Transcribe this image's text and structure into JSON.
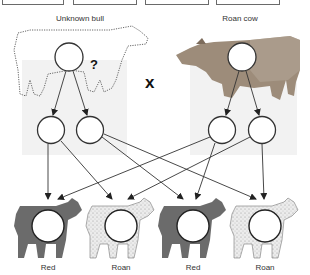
{
  "top_boxes": [
    {
      "name": "answer-box-1"
    },
    {
      "name": "answer-box-2"
    },
    {
      "name": "answer-box-3"
    },
    {
      "name": "answer-box-4"
    }
  ],
  "parents": {
    "left": {
      "label": "Unknown bull",
      "marker": "?"
    },
    "right": {
      "label": "Roan cow"
    },
    "cross_symbol": "x"
  },
  "offspring": [
    {
      "label": "Red",
      "coat": "red"
    },
    {
      "label": "Roan",
      "coat": "roan"
    },
    {
      "label": "Red",
      "coat": "red"
    },
    {
      "label": "Roan",
      "coat": "roan"
    }
  ],
  "colors": {
    "red_calf": "#6b6b6b",
    "roan_calf": "#e4e4e4",
    "cow_body": "#9a8a78",
    "shade_panel": "#f0f0f0",
    "line": "#333333"
  }
}
